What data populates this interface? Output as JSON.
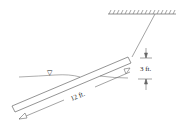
{
  "diagram": {
    "type": "physics-free-body",
    "labels": {
      "rod_length": "12 ft.",
      "vertical_height": "3 ft.",
      "water_surface_symbol": "▽"
    },
    "elements": {
      "ceiling": "hatched support",
      "string": "cable from ceiling to upper rod end",
      "rod": "uniform slender rod",
      "water_surface": "free surface line"
    },
    "colors": {
      "line": "#555555",
      "background": "#ffffff"
    }
  }
}
